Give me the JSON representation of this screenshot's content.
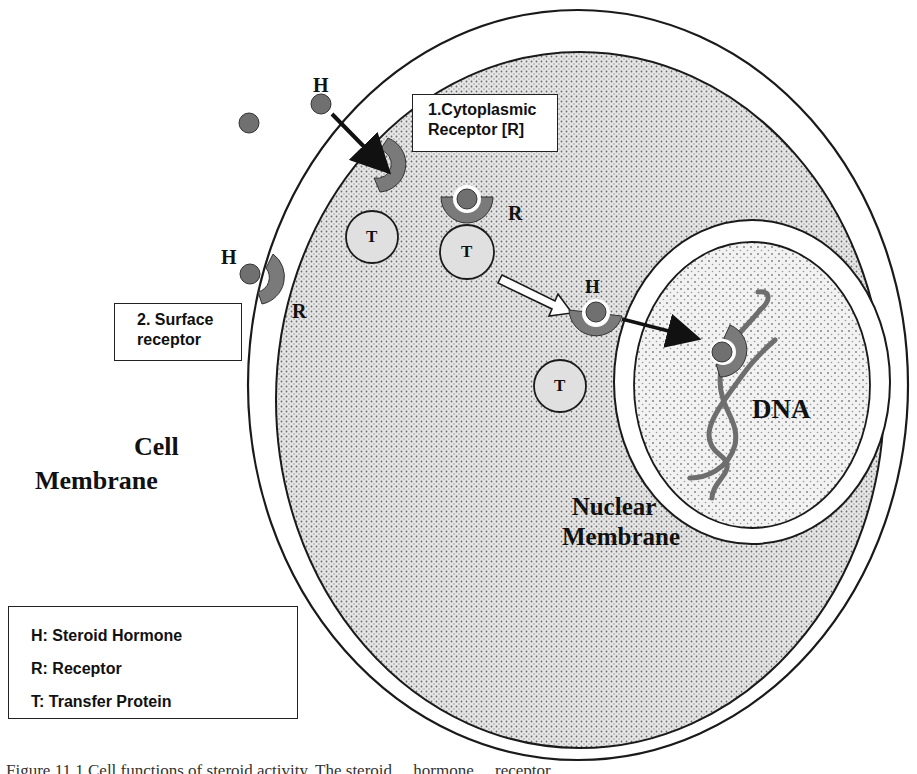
{
  "figure": {
    "type": "biological-diagram",
    "regions": {
      "cell_membrane_label": [
        "Cell",
        "Membrane"
      ],
      "nuclear_membrane_label": [
        "Nuclear",
        "Membrane"
      ],
      "dna_label": "DNA"
    },
    "callouts": {
      "cytoplasmic_receptor": [
        "1.Cytoplasmic",
        "Receptor [R]"
      ],
      "surface_receptor": [
        "2. Surface",
        "receptor"
      ]
    },
    "symbols": {
      "hormone": "H",
      "receptor": "R",
      "transfer_protein": "T"
    },
    "legend": {
      "items": [
        "H: Steroid Hormone",
        "R: Receptor",
        "T: Transfer Protein"
      ]
    },
    "colors": {
      "cytoplasm_fill": "#d9d9d9",
      "nucleus_fill": "#ececec",
      "receptor_fill": "#7a7a7a",
      "hormone_fill": "#707070",
      "transfer_protein_fill": "#e0e0e0",
      "dna_stroke": "#6e6e6e",
      "outline": "#1a1a1a"
    }
  },
  "caption": {
    "text": "Figure 11.1   Cell functions of steroid activity. The steroid ... hormone ... receptor ..."
  }
}
